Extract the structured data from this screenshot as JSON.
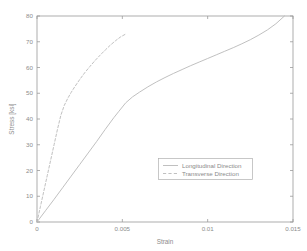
{
  "figure": {
    "background_color": "#ffffff",
    "axis_color": "#9a9a9a",
    "text_color": "#8c8c8c"
  },
  "chart_data": {
    "type": "line",
    "title": "",
    "xlabel": "Strain",
    "ylabel": "Stress [ksi]",
    "xlim": [
      0,
      0.015
    ],
    "ylim": [
      0,
      80
    ],
    "xticks": [
      0,
      0.005,
      0.01,
      0.015
    ],
    "xtick_labels": [
      "0",
      "0.005",
      "0.01",
      "0.015"
    ],
    "yticks": [
      0,
      10,
      20,
      30,
      40,
      50,
      60,
      70,
      80
    ],
    "ytick_labels": [
      "0",
      "10",
      "20",
      "30",
      "40",
      "50",
      "60",
      "70",
      "80"
    ],
    "grid": false,
    "legend_position": "center-right",
    "series": [
      {
        "name": "Longitudinal Direction",
        "style": "solid",
        "color": "#b9b9b9",
        "x": [
          0,
          0.0005,
          0.001,
          0.0015,
          0.002,
          0.0025,
          0.003,
          0.0035,
          0.004,
          0.0045,
          0.0048,
          0.0052,
          0.0056,
          0.006,
          0.0065,
          0.007,
          0.0075,
          0.008,
          0.0085,
          0.009,
          0.0095,
          0.01,
          0.0105,
          0.011,
          0.0115,
          0.012,
          0.0125,
          0.013,
          0.0135,
          0.014,
          0.0145
        ],
        "y": [
          0,
          4.4,
          8.8,
          13.3,
          17.8,
          22.3,
          26.8,
          31.3,
          36.0,
          40.5,
          43.0,
          46.3,
          48.6,
          50.4,
          52.5,
          54.4,
          56.1,
          57.7,
          59.2,
          60.7,
          62.1,
          63.5,
          64.9,
          66.3,
          67.7,
          69.2,
          70.8,
          72.6,
          74.6,
          77.0,
          80.0
        ]
      },
      {
        "name": "Transverse Direction",
        "style": "dashed",
        "color": "#b9b9b9",
        "x": [
          0,
          0.0002,
          0.0004,
          0.0006,
          0.0008,
          0.001,
          0.0012,
          0.0014,
          0.0016,
          0.0018,
          0.002,
          0.0022,
          0.0025,
          0.0028,
          0.0031,
          0.0034,
          0.0037,
          0.004,
          0.0043,
          0.0046,
          0.0049,
          0.0052
        ],
        "y": [
          0,
          6.0,
          12.0,
          18.0,
          24.0,
          30.0,
          36.0,
          41.5,
          45.3,
          48.0,
          50.3,
          52.4,
          55.3,
          58.0,
          60.4,
          62.7,
          64.8,
          66.8,
          68.7,
          70.4,
          71.9,
          73.0
        ]
      }
    ]
  },
  "legend": {
    "entries": [
      {
        "label": "Longitudinal Direction",
        "style": "solid"
      },
      {
        "label": "Transverse Direction",
        "style": "dashed"
      }
    ]
  }
}
